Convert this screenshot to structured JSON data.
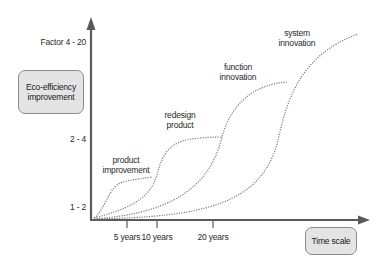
{
  "diagram": {
    "y_axis_box": {
      "line1": "Eco-efficiency",
      "line2": "improvement"
    },
    "x_axis_box": {
      "label": "Time scale"
    },
    "y_ticks": [
      {
        "label": "Factor 4 - 20"
      },
      {
        "label": "2 - 4"
      },
      {
        "label": "1 - 2"
      }
    ],
    "x_ticks": [
      {
        "label": "5 years"
      },
      {
        "label": "10 years"
      },
      {
        "label": "20 years"
      }
    ],
    "curves": [
      {
        "line1": "product",
        "line2": "improvement"
      },
      {
        "line1": "redesign",
        "line2": "product"
      },
      {
        "line1": "function",
        "line2": "innovation"
      },
      {
        "line1": "system",
        "line2": "innovation"
      }
    ],
    "colors": {
      "axis": "#5a5a5a",
      "curve": "#7a7a7a",
      "box_fill": "#e4e4e4",
      "box_border": "#8a8a8a"
    }
  }
}
